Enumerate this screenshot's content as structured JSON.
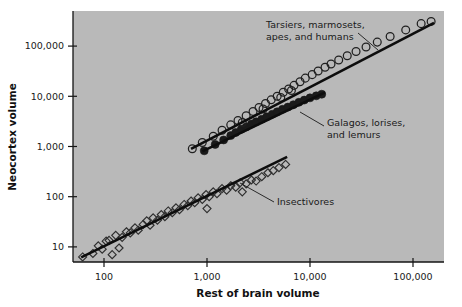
{
  "chart_data": {
    "type": "scatter",
    "title": "",
    "xlabel": "Rest of brain volume",
    "ylabel": "Neocortex volume",
    "xscale": "log",
    "yscale": "log",
    "xlim": [
      50,
      200000
    ],
    "ylim": [
      5,
      500000
    ],
    "grid": false,
    "legend": "none",
    "plot_background": "#b9b9b9",
    "marker_color": "#1a1a1a",
    "xticks": [
      100,
      1000,
      10000,
      100000
    ],
    "xtick_labels": [
      "100",
      "1,000",
      "10,000",
      "100,000"
    ],
    "yticks": [
      10,
      100,
      1000,
      10000,
      100000
    ],
    "ytick_labels": [
      "10",
      "100",
      "1,000",
      "10,000",
      "100,000"
    ],
    "series": [
      {
        "name": "Insectivores",
        "marker": "open-diamond",
        "fit_line": {
          "x": [
            60,
            6000
          ],
          "y": [
            6.2,
            620
          ]
        },
        "points": [
          [
            62,
            6.3
          ],
          [
            78,
            7.4
          ],
          [
            88,
            10.5
          ],
          [
            96,
            9.0
          ],
          [
            105,
            13.0
          ],
          [
            112,
            13.5
          ],
          [
            120,
            7.0
          ],
          [
            130,
            17.0
          ],
          [
            150,
            15.5
          ],
          [
            165,
            20.0
          ],
          [
            180,
            19.0
          ],
          [
            200,
            24.0
          ],
          [
            215,
            21.5
          ],
          [
            240,
            28.0
          ],
          [
            260,
            33.0
          ],
          [
            280,
            27.0
          ],
          [
            300,
            38.0
          ],
          [
            330,
            34.0
          ],
          [
            360,
            44.0
          ],
          [
            390,
            40.0
          ],
          [
            420,
            52.0
          ],
          [
            460,
            48.0
          ],
          [
            500,
            60.0
          ],
          [
            540,
            55.0
          ],
          [
            600,
            70.0
          ],
          [
            650,
            66.0
          ],
          [
            700,
            82.0
          ],
          [
            760,
            76.0
          ],
          [
            820,
            95.0
          ],
          [
            900,
            88.0
          ],
          [
            980,
            110.0
          ],
          [
            1050,
            100.0
          ],
          [
            1150,
            125.0
          ],
          [
            1250,
            115.0
          ],
          [
            1400,
            145.0
          ],
          [
            1550,
            135.0
          ],
          [
            1700,
            165.0
          ],
          [
            1900,
            155.0
          ],
          [
            2100,
            190.0
          ],
          [
            2400,
            180.0
          ],
          [
            2700,
            215.0
          ],
          [
            3000,
            205.0
          ],
          [
            3400,
            250.0
          ],
          [
            3900,
            300.0
          ],
          [
            4400,
            330.0
          ],
          [
            5000,
            380.0
          ],
          [
            5800,
            440.0
          ],
          [
            2200,
            125.0
          ],
          [
            1000,
            58.0
          ],
          [
            140,
            9.5
          ]
        ]
      },
      {
        "name": "Galagos, lorises, and lemurs",
        "marker": "filled-circle",
        "fit_line": {
          "x": [
            900,
            14000
          ],
          "y": [
            800,
            12000
          ]
        },
        "points": [
          [
            940,
            820
          ],
          [
            1200,
            1100
          ],
          [
            1450,
            1350
          ],
          [
            1700,
            1650
          ],
          [
            1900,
            1900
          ],
          [
            2150,
            2200
          ],
          [
            2400,
            2450
          ],
          [
            2700,
            2800
          ],
          [
            3000,
            3100
          ],
          [
            3400,
            3500
          ],
          [
            3800,
            3900
          ],
          [
            4300,
            4400
          ],
          [
            4800,
            4900
          ],
          [
            5400,
            5500
          ],
          [
            6100,
            6100
          ],
          [
            6900,
            6800
          ],
          [
            7800,
            7600
          ],
          [
            8800,
            8400
          ],
          [
            10000,
            9300
          ],
          [
            11500,
            10200
          ],
          [
            13000,
            11000
          ]
        ]
      },
      {
        "name": "Tarsiers, marmosets, apes, and humans",
        "marker": "open-circle",
        "fit_line": {
          "x": [
            700,
            160000
          ],
          "y": [
            900,
            290000
          ]
        },
        "points": [
          [
            720,
            900
          ],
          [
            900,
            1200
          ],
          [
            1150,
            1600
          ],
          [
            1400,
            2100
          ],
          [
            1700,
            2700
          ],
          [
            2000,
            3300
          ],
          [
            2400,
            4100
          ],
          [
            2800,
            5000
          ],
          [
            3200,
            6000
          ],
          [
            3700,
            7200
          ],
          [
            4200,
            8500
          ],
          [
            4800,
            10000
          ],
          [
            5500,
            12000
          ],
          [
            6200,
            14000
          ],
          [
            7000,
            16500
          ],
          [
            8000,
            19500
          ],
          [
            9000,
            23000
          ],
          [
            10500,
            27000
          ],
          [
            12000,
            32000
          ],
          [
            14000,
            38000
          ],
          [
            16000,
            44000
          ],
          [
            19000,
            53000
          ],
          [
            23000,
            64000
          ],
          [
            28000,
            78000
          ],
          [
            35000,
            96000
          ],
          [
            45000,
            120000
          ],
          [
            60000,
            155000
          ],
          [
            85000,
            210000
          ],
          [
            120000,
            280000
          ],
          [
            150000,
            310000
          ],
          [
            6600,
            13000
          ],
          [
            5200,
            9500
          ],
          [
            3500,
            5600
          ],
          [
            2200,
            3000
          ]
        ]
      }
    ],
    "annotations": [
      {
        "id": "annotation-haplorhines",
        "lines": [
          "Tarsiers, marmosets,",
          "apes, and humans"
        ],
        "text_x": 266,
        "text_y": 28,
        "leader": [
          [
            358,
            33
          ],
          [
            378,
            50
          ]
        ]
      },
      {
        "id": "annotation-strepsirrhines",
        "lines": [
          "Galagos, lorises,",
          "and lemurs"
        ],
        "text_x": 327,
        "text_y": 126,
        "leader": [
          [
            324,
            126
          ],
          [
            300,
            112
          ]
        ]
      },
      {
        "id": "annotation-insectivores",
        "lines": [
          "Insectivores"
        ],
        "text_x": 277,
        "text_y": 205,
        "leader": [
          [
            274,
            202
          ],
          [
            240,
            183
          ]
        ]
      }
    ]
  },
  "axis": {
    "x_title": "Rest of brain volume",
    "y_title": "Neocortex volume"
  },
  "geometry": {
    "plot_left": 73,
    "plot_right": 444,
    "plot_top": 11,
    "plot_bottom": 262
  }
}
